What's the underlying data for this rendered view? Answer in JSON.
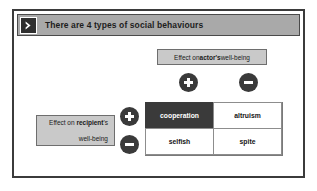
{
  "slide": {
    "title": "There are 4 types of social behaviours",
    "title_icon": "chevron-right-icon"
  },
  "axes": {
    "actor": {
      "label_prefix": "Effect on ",
      "label_emphasis": "actor's",
      "label_suffix": " well-being",
      "signs": [
        {
          "name": "plus",
          "symbol": "+"
        },
        {
          "name": "minus",
          "symbol": "−"
        }
      ]
    },
    "recipient": {
      "label_line1_prefix": "Effect on ",
      "label_line1_emphasis": "recipient",
      "label_line1_suffix": "'s",
      "label_line2": "well-being",
      "signs": [
        {
          "name": "plus",
          "symbol": "+"
        },
        {
          "name": "minus",
          "symbol": "−"
        }
      ]
    }
  },
  "matrix": {
    "cells": [
      {
        "label": "cooperation",
        "actor": "+",
        "recipient": "+",
        "highlighted": true
      },
      {
        "label": "altruism",
        "actor": "-",
        "recipient": "+",
        "highlighted": false
      },
      {
        "label": "selfish",
        "actor": "+",
        "recipient": "-",
        "highlighted": false
      },
      {
        "label": "spite",
        "actor": "-",
        "recipient": "-",
        "highlighted": false
      }
    ]
  },
  "colors": {
    "frame_border": "#3b3b3b",
    "title_bar": "#a9a9a9",
    "label_box": "#c9c9c9",
    "accent_dark": "#3a3a3a",
    "cell_text": "#141414"
  }
}
